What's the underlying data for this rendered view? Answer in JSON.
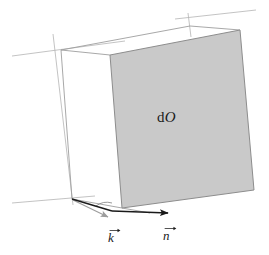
{
  "figure": {
    "type": "geometry-diagram",
    "background_color": "#ffffff",
    "face_fill_color": "#c9c9c9",
    "construction_line_color": "#b0b0b0",
    "edge_line_color": "#8a8a8a",
    "arrow_color": "#1a1a1a",
    "arrow_gray_color": "#9a9a9a",
    "labels": {
      "surface_element_prefix": "d",
      "surface_element_symbol": "O",
      "wave_vector": "k",
      "normal_vector": "n"
    },
    "vectors": [
      {
        "name": "wave-vector",
        "label": "k",
        "origin": [
          72,
          199
        ],
        "tip": [
          113,
          219
        ],
        "style": "solid-black-arrow"
      },
      {
        "name": "normal-vector",
        "label": "n",
        "origin": [
          110,
          211
        ],
        "tip": [
          172,
          213
        ],
        "style": "solid-black-arrow"
      }
    ],
    "shaded_face": {
      "name": "dO-face",
      "corners": [
        [
          110,
          55
        ],
        [
          240,
          30
        ],
        [
          254,
          190
        ],
        [
          122,
          208
        ]
      ]
    },
    "angle_arc": {
      "name": "incidence-angle-arc",
      "vertex": [
        110,
        211
      ]
    }
  }
}
